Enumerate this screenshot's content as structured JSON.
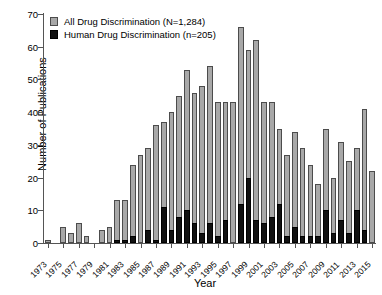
{
  "chart_data": {
    "type": "bar",
    "stacked": true,
    "title": "",
    "xlabel": "Year",
    "ylabel": "Number of Publications",
    "ylim": [
      0,
      70
    ],
    "ytick_values": [
      0,
      10,
      20,
      30,
      40,
      50,
      60,
      70
    ],
    "ytick_labels": [
      "0",
      "10",
      "20",
      "30",
      "40",
      "50",
      "60",
      "70"
    ],
    "grid": false,
    "legend_position": "top-left",
    "categories": [
      1973,
      1974,
      1975,
      1976,
      1977,
      1978,
      1979,
      1980,
      1981,
      1982,
      1983,
      1984,
      1985,
      1986,
      1987,
      1988,
      1989,
      1990,
      1991,
      1992,
      1993,
      1994,
      1995,
      1996,
      1997,
      1998,
      1999,
      2000,
      2001,
      2002,
      2003,
      2004,
      2005,
      2006,
      2007,
      2008,
      2009,
      2010,
      2011,
      2012,
      2013,
      2014,
      2015
    ],
    "xtick_labels": [
      "1973",
      "1975",
      "1977",
      "1979",
      "1981",
      "1983",
      "1985",
      "1987",
      "1989",
      "1991",
      "1993",
      "1995",
      "1997",
      "1999",
      "2001",
      "2003",
      "2005",
      "2007",
      "2009",
      "2011",
      "2013",
      "2015"
    ],
    "series": [
      {
        "name": "All Drug Discrimination (N=1,284)",
        "color": "#a8a8a8",
        "values": [
          1,
          0,
          5,
          3,
          6,
          2,
          0,
          4,
          5,
          13,
          13,
          24,
          27,
          29,
          36,
          37,
          40,
          45,
          53,
          46,
          48,
          54,
          43,
          43,
          43,
          66,
          59,
          62,
          43,
          43,
          35,
          27,
          34,
          29,
          24,
          18,
          35,
          20,
          31,
          25,
          29,
          41,
          22
        ]
      },
      {
        "name": "Human Drug Discrimination (n=205)",
        "color": "#111111",
        "values": [
          0,
          0,
          0,
          0,
          0,
          0,
          0,
          0,
          0,
          1,
          1,
          2,
          0,
          4,
          1,
          11,
          4,
          8,
          10,
          6,
          3,
          6,
          2,
          7,
          0,
          12,
          20,
          7,
          6,
          8,
          12,
          2,
          5,
          2,
          2,
          2,
          10,
          3,
          7,
          3,
          10,
          4,
          0
        ]
      }
    ]
  },
  "legend": {
    "items": [
      {
        "label": "All Drug Discrimination (N=1,284)",
        "swatch": "all"
      },
      {
        "label": "Human Drug Discrimination (n=205)",
        "swatch": "human"
      }
    ]
  }
}
